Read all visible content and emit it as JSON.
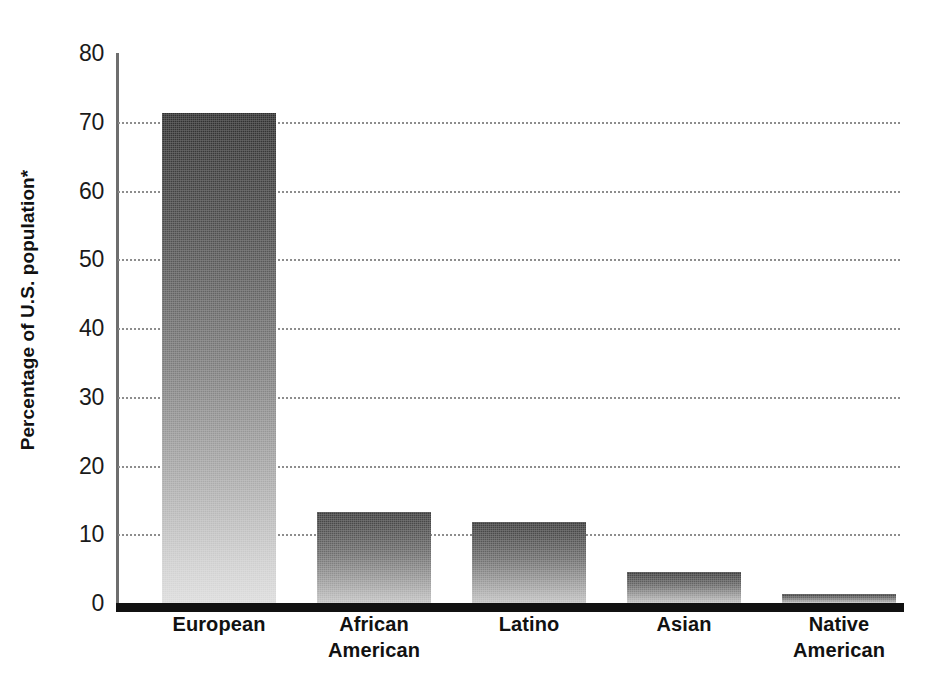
{
  "chart_data": {
    "type": "bar",
    "title": "",
    "subtitle": "",
    "xlabel": "",
    "ylabel": "Percentage of U.S. population*",
    "categories": [
      "European",
      "African American",
      "Latino",
      "Asian",
      "Native American"
    ],
    "category_lines": [
      [
        "European"
      ],
      [
        "African",
        "American"
      ],
      [
        "Latino"
      ],
      [
        "Asian"
      ],
      [
        "Native",
        "American"
      ]
    ],
    "values": [
      71.3,
      13.3,
      11.8,
      4.5,
      1.3
    ],
    "ylim": [
      0,
      80
    ],
    "yticks": [
      80,
      70,
      60,
      50,
      40,
      30,
      20,
      10,
      0
    ],
    "ytick_labels": [
      "80",
      "70",
      "60",
      "50",
      "40",
      "30",
      "20",
      "10",
      "0"
    ],
    "gridlines": [
      70,
      60,
      50,
      40,
      30,
      20,
      10
    ],
    "grid": true,
    "legend": null,
    "legend_position": "none",
    "annotations": [],
    "colors": {
      "bar_gradient_top": "#2f2f2f",
      "bar_gradient_bottom": "#dcdcdc",
      "axis": "#111111",
      "gridline": "#8d8d8d",
      "text": "#111111",
      "background": "#ffffff"
    }
  }
}
